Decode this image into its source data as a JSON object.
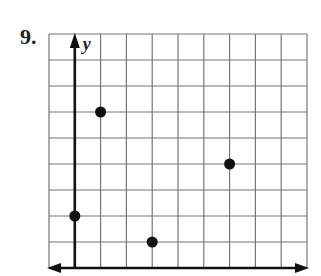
{
  "problem": {
    "number": "9."
  },
  "graph": {
    "y_axis_label": "y",
    "grid": {
      "columns": 10,
      "rows": 9,
      "x_min": -1,
      "x_max": 9,
      "y_min": 0,
      "y_max": 9
    },
    "points": [
      {
        "x": 1,
        "y": 6
      },
      {
        "x": 0,
        "y": 2
      },
      {
        "x": 3,
        "y": 1
      },
      {
        "x": 6,
        "y": 4
      }
    ],
    "colors": {
      "grid": "#777777",
      "axis": "#111111",
      "point": "#111111"
    }
  },
  "chart_data": {
    "type": "scatter",
    "title": "9.",
    "xlabel": "",
    "ylabel": "y",
    "points": [
      [
        1,
        6
      ],
      [
        0,
        2
      ],
      [
        3,
        1
      ],
      [
        6,
        4
      ]
    ],
    "xlim": [
      -1,
      9
    ],
    "ylim": [
      0,
      9
    ],
    "grid": true
  }
}
